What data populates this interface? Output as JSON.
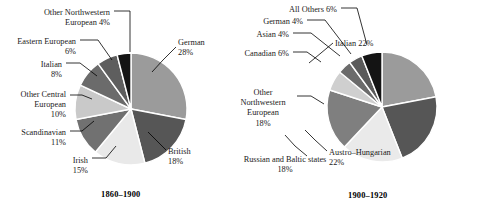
{
  "figure": {
    "panels": [
      {
        "id": "left",
        "caption": "1860–1900",
        "chart_data": {
          "type": "pie",
          "title": "1860–1900",
          "categories": [
            "German",
            "British",
            "Irish",
            "Scandinavian",
            "Other Central European",
            "Italian",
            "Eastern European",
            "Other Northwestern European"
          ],
          "values": [
            28,
            18,
            15,
            11,
            10,
            8,
            6,
            4
          ],
          "unit": "percent",
          "start_angle_deg": 0,
          "direction": "clockwise",
          "colors": [
            "#9b9b9b",
            "#565656",
            "#e9e9e9",
            "#717171",
            "#c9c9c9",
            "#6b6b6b",
            "#5e5e5e",
            "#141414"
          ],
          "labels": [
            {
              "name": "German",
              "text": "German\n28%",
              "percent": 28
            },
            {
              "name": "British",
              "text": "British\n18%",
              "percent": 18
            },
            {
              "name": "Irish",
              "text": "Irish\n15%",
              "percent": 15
            },
            {
              "name": "Scandinavian",
              "text": "Scandinavian\n11%",
              "percent": 11
            },
            {
              "name": "Other Central European",
              "text": "Other Central\nEuropean\n10%",
              "percent": 10
            },
            {
              "name": "Italian",
              "text": "Italian\n8%",
              "percent": 8
            },
            {
              "name": "Eastern European",
              "text": "Eastern European\n6%",
              "percent": 6
            },
            {
              "name": "Other Northwestern European",
              "text": "Other Northwestern\nEuropean 4%",
              "percent": 4
            }
          ],
          "legend": "none",
          "grid": false
        }
      },
      {
        "id": "right",
        "caption": "1900–1920",
        "chart_data": {
          "type": "pie",
          "title": "1900–1920",
          "categories": [
            "Italian",
            "Austro-Hungarian",
            "Russian and Baltic states",
            "Other Northwestern European",
            "Canadian",
            "Asian",
            "German",
            "All Others"
          ],
          "values": [
            22,
            22,
            18,
            18,
            6,
            4,
            4,
            6
          ],
          "unit": "percent",
          "start_angle_deg": 0,
          "direction": "clockwise",
          "colors": [
            "#9b9b9b",
            "#565656",
            "#eaeaea",
            "#7f7f7f",
            "#cfcfcf",
            "#6b6b6b",
            "#5a5a5a",
            "#141414"
          ],
          "labels": [
            {
              "name": "Italian",
              "text": "Italian 22%",
              "percent": 22
            },
            {
              "name": "Austro-Hungarian",
              "text": "Austro–Hungarian\n22%",
              "percent": 22
            },
            {
              "name": "Russian and Baltic states",
              "text": "Russian and Baltic states\n18%",
              "percent": 18
            },
            {
              "name": "Other Northwestern European",
              "text": "Other\nNorthwestern\nEuropean\n18%",
              "percent": 18
            },
            {
              "name": "Canadian",
              "text": "Canadian 6%",
              "percent": 6
            },
            {
              "name": "Asian",
              "text": "Asian 4%",
              "percent": 4
            },
            {
              "name": "German",
              "text": "German 4%",
              "percent": 4
            },
            {
              "name": "All Others",
              "text": "All Others 6%",
              "percent": 6
            }
          ],
          "legend": "none",
          "grid": false
        }
      }
    ]
  },
  "geometry": {
    "left": {
      "cx": 131,
      "cy": 109,
      "r": 56
    },
    "right": {
      "cx": 143,
      "cy": 107,
      "r": 55
    }
  },
  "label_positions": {
    "left": [
      {
        "key": "German",
        "x": 178,
        "y": 38,
        "w": 58,
        "align": "l",
        "lx1": 176,
        "ly1": 47,
        "lx2": 163,
        "ly2": 60,
        "lx3": 152,
        "ly3": 72
      },
      {
        "key": "British",
        "x": 168,
        "y": 147,
        "w": 56,
        "align": "l",
        "lx1": 166,
        "ly1": 150,
        "lx2": 156,
        "ly2": 140,
        "lx3": 148,
        "ly3": 132
      },
      {
        "key": "Irish",
        "x": 50,
        "y": 156,
        "w": 38,
        "align": "r",
        "lx1": 92,
        "ly1": 158,
        "lx2": 106,
        "ly2": 158,
        "lx3": 116,
        "ly3": 146
      },
      {
        "key": "Scandinavian",
        "x": 4,
        "y": 128,
        "w": 62,
        "align": "r",
        "lx1": 70,
        "ly1": 131,
        "lx2": 82,
        "ly2": 131,
        "lx3": 94,
        "ly3": 121
      },
      {
        "key": "Other Central European",
        "x": 0,
        "y": 90,
        "w": 66,
        "align": "r",
        "lx1": 70,
        "ly1": 95,
        "lx2": 82,
        "ly2": 95,
        "lx3": 92,
        "ly3": 99
      },
      {
        "key": "Italian",
        "x": 14,
        "y": 60,
        "w": 48,
        "align": "r",
        "lx1": 66,
        "ly1": 63,
        "lx2": 80,
        "ly2": 63,
        "lx3": 97,
        "ly3": 76
      },
      {
        "key": "Eastern European",
        "x": 2,
        "y": 37,
        "w": 74,
        "align": "r",
        "lx1": 80,
        "ly1": 40,
        "lx2": 98,
        "ly2": 40,
        "lx3": 112,
        "ly3": 60
      },
      {
        "key": "Other Northwestern European",
        "x": 22,
        "y": 8,
        "w": 88,
        "align": "r",
        "lx1": 114,
        "ly1": 11,
        "lx2": 130,
        "ly2": 11,
        "lx3": 130,
        "ly3": 52
      }
    ],
    "right": [
      {
        "key": "Italian",
        "x": 96,
        "y": 39,
        "w": 62,
        "align": "l",
        "lx1": 94,
        "ly1": 43,
        "lx2": 82,
        "ly2": 53,
        "lx3": 70,
        "ly3": 63
      },
      {
        "key": "Austro-Hungarian",
        "x": 90,
        "y": 148,
        "w": 68,
        "align": "l",
        "lx1": 88,
        "ly1": 151,
        "lx2": 76,
        "ly2": 140,
        "lx3": 66,
        "ly3": 130
      },
      {
        "key": "Russian and Baltic states",
        "x": -6,
        "y": 155,
        "w": 104,
        "align": "c",
        "lx1": 68,
        "ly1": 156,
        "lx2": 56,
        "ly2": 146,
        "lx3": 46,
        "ly3": 135
      },
      {
        "key": "Other Northwestern European",
        "x": -8,
        "y": 88,
        "w": 64,
        "align": "c",
        "lx1": 58,
        "ly1": 96,
        "lx2": 72,
        "ly2": 96,
        "lx3": 85,
        "ly3": 104
      },
      {
        "key": "Canadian",
        "x": -6,
        "y": 49,
        "w": 56,
        "align": "r",
        "lx1": 54,
        "ly1": 52,
        "lx2": 68,
        "ly2": 52,
        "lx3": 82,
        "ly3": 62
      },
      {
        "key": "Asian",
        "x": 6,
        "y": 30,
        "w": 44,
        "align": "r",
        "lx1": 54,
        "ly1": 33,
        "lx2": 72,
        "ly2": 33,
        "lx3": 101,
        "ly3": 56
      },
      {
        "key": "German",
        "x": 12,
        "y": 17,
        "w": 52,
        "align": "r",
        "lx1": 68,
        "ly1": 20,
        "lx2": 86,
        "ly2": 20,
        "lx3": 112,
        "ly3": 54
      },
      {
        "key": "All Others",
        "x": 40,
        "y": 5,
        "w": 58,
        "align": "r",
        "lx1": 102,
        "ly1": 8,
        "lx2": 118,
        "ly2": 8,
        "lx3": 128,
        "ly3": 45
      }
    ]
  },
  "caption_positions": {
    "left": {
      "x": 101,
      "y": 190
    },
    "right": {
      "x": 109,
      "y": 191
    }
  }
}
